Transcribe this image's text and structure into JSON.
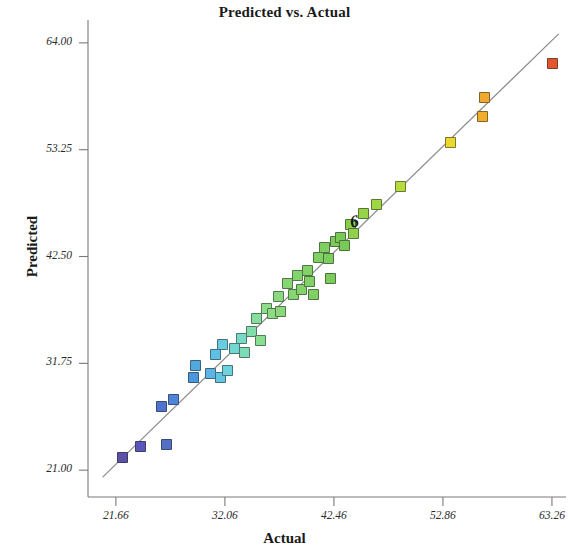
{
  "chart_data": {
    "type": "scatter",
    "title": "Predicted vs. Actual",
    "xlabel": "Actual",
    "ylabel": "Predicted",
    "xlim": [
      19.0,
      64.6
    ],
    "ylim": [
      18.3,
      66.3
    ],
    "xticks": [
      "21.66",
      "32.06",
      "42.46",
      "52.86",
      "63.26"
    ],
    "xtick_values": [
      21.66,
      32.06,
      42.46,
      52.86,
      63.26
    ],
    "yticks": [
      "64.00",
      "53.25",
      "42.50",
      "31.75",
      "21.00"
    ],
    "ytick_values": [
      64.0,
      53.25,
      42.5,
      31.75,
      21.0
    ],
    "grid": false,
    "legend": null,
    "reference_line": {
      "name": "identity-fit-line",
      "x0": 20.4,
      "y0": 20.3,
      "x1": 63.9,
      "y1": 64.9,
      "color": "#8a8a8a"
    },
    "annotation": {
      "text": "6",
      "x": 44.6,
      "y": 45.9
    },
    "marker_shape": "square",
    "colormap": "jet-like blue-cyan-green-yellow-orange-red by value",
    "points": [
      {
        "x": 22.3,
        "y": 22.3,
        "color": "#5b51a8"
      },
      {
        "x": 24.0,
        "y": 23.4,
        "color": "#5a55b8"
      },
      {
        "x": 26.5,
        "y": 23.6,
        "color": "#5470c4"
      },
      {
        "x": 26.0,
        "y": 27.4,
        "color": "#4f73cf"
      },
      {
        "x": 27.2,
        "y": 28.1,
        "color": "#4d86d8"
      },
      {
        "x": 29.1,
        "y": 30.3,
        "color": "#4a97dd"
      },
      {
        "x": 29.3,
        "y": 31.5,
        "color": "#54a8e0"
      },
      {
        "x": 30.7,
        "y": 30.7,
        "color": "#5bb4e4"
      },
      {
        "x": 31.2,
        "y": 32.6,
        "color": "#5fc0e6"
      },
      {
        "x": 31.6,
        "y": 30.3,
        "color": "#62c6e3"
      },
      {
        "x": 31.8,
        "y": 33.6,
        "color": "#68cde0"
      },
      {
        "x": 32.3,
        "y": 31.0,
        "color": "#6dd2dc"
      },
      {
        "x": 33.0,
        "y": 33.2,
        "color": "#72d6d2"
      },
      {
        "x": 33.6,
        "y": 34.2,
        "color": "#77d9c6"
      },
      {
        "x": 33.9,
        "y": 32.8,
        "color": "#7cdcb8"
      },
      {
        "x": 34.6,
        "y": 35.0,
        "color": "#81ddab"
      },
      {
        "x": 35.1,
        "y": 36.3,
        "color": "#86de9d"
      },
      {
        "x": 35.5,
        "y": 34.0,
        "color": "#8ade92"
      },
      {
        "x": 36.0,
        "y": 37.3,
        "color": "#8ddd8b"
      },
      {
        "x": 36.6,
        "y": 36.8,
        "color": "#8ddb84"
      },
      {
        "x": 37.2,
        "y": 38.5,
        "color": "#8bd97e"
      },
      {
        "x": 37.4,
        "y": 37.0,
        "color": "#89d879"
      },
      {
        "x": 38.0,
        "y": 39.8,
        "color": "#87d674"
      },
      {
        "x": 38.6,
        "y": 38.7,
        "color": "#85d570"
      },
      {
        "x": 39.0,
        "y": 40.6,
        "color": "#84d46d"
      },
      {
        "x": 39.4,
        "y": 39.2,
        "color": "#83d36b"
      },
      {
        "x": 39.9,
        "y": 41.1,
        "color": "#82d268"
      },
      {
        "x": 40.1,
        "y": 40.0,
        "color": "#81d166"
      },
      {
        "x": 40.5,
        "y": 38.7,
        "color": "#80d064"
      },
      {
        "x": 41.0,
        "y": 42.4,
        "color": "#7fcf62"
      },
      {
        "x": 41.6,
        "y": 43.4,
        "color": "#7ece60"
      },
      {
        "x": 41.9,
        "y": 42.3,
        "color": "#7dcd5e"
      },
      {
        "x": 42.1,
        "y": 40.3,
        "color": "#7ccc5c"
      },
      {
        "x": 42.6,
        "y": 44.0,
        "color": "#7bcb5a"
      },
      {
        "x": 43.1,
        "y": 44.4,
        "color": "#7aca58"
      },
      {
        "x": 43.5,
        "y": 43.6,
        "color": "#79c956"
      },
      {
        "x": 44.0,
        "y": 45.7,
        "color": "#86cf4e"
      },
      {
        "x": 44.3,
        "y": 44.8,
        "color": "#8fd14a"
      },
      {
        "x": 45.3,
        "y": 46.8,
        "color": "#97d446"
      },
      {
        "x": 46.5,
        "y": 47.7,
        "color": "#9fd742"
      },
      {
        "x": 48.8,
        "y": 49.5,
        "color": "#b5dc3c"
      },
      {
        "x": 53.6,
        "y": 54.0,
        "color": "#ead92c"
      },
      {
        "x": 56.6,
        "y": 56.6,
        "color": "#f0ae2c"
      },
      {
        "x": 56.8,
        "y": 58.5,
        "color": "#f0a82e"
      },
      {
        "x": 63.3,
        "y": 61.9,
        "color": "#e2562b"
      }
    ]
  },
  "axis": {
    "frame_color": "#7a7a7a",
    "tick_color": "#7a7a7a"
  }
}
